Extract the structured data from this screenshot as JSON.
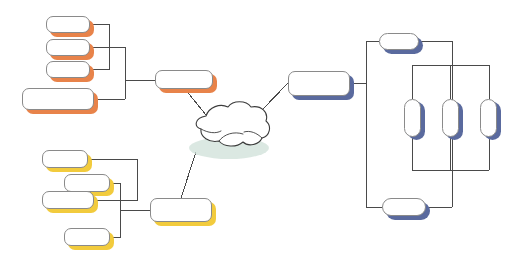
{
  "diagram": {
    "type": "network-topology",
    "background": "#ffffff",
    "line_color": "#4a4a4a",
    "node_border": "#8a8a8a",
    "node_fill": "#ffffff",
    "palette": {
      "orange": "#e8834a",
      "yellow": "#f2cb3d",
      "blue": "#5a6a9e",
      "cloud_shadow": "#cfe0d8",
      "cloud_outline": "#3c3c3c"
    },
    "groups": [
      {
        "id": "orange-group",
        "label": "",
        "color": "#e8834a"
      },
      {
        "id": "yellow-group",
        "label": "",
        "color": "#f2cb3d"
      },
      {
        "id": "blue-group",
        "label": "",
        "color": "#5a6a9e"
      }
    ],
    "cloud": {
      "label": "",
      "x": 186,
      "y": 104,
      "w": 84,
      "h": 48
    },
    "nodes": [
      {
        "id": "o1",
        "label": "",
        "group": "orange",
        "shape": "rounded",
        "x": 46,
        "y": 16,
        "w": 44,
        "h": 17
      },
      {
        "id": "o2",
        "label": "",
        "group": "orange",
        "shape": "rounded",
        "x": 46,
        "y": 39,
        "w": 44,
        "h": 17
      },
      {
        "id": "o3",
        "label": "",
        "group": "orange",
        "shape": "rounded",
        "x": 46,
        "y": 61,
        "w": 44,
        "h": 17
      },
      {
        "id": "o4",
        "label": "",
        "group": "orange",
        "shape": "rounded",
        "x": 22,
        "y": 88,
        "w": 72,
        "h": 22
      },
      {
        "id": "o5",
        "label": "",
        "group": "orange",
        "shape": "rounded",
        "x": 155,
        "y": 70,
        "w": 58,
        "h": 19
      },
      {
        "id": "y1",
        "label": "",
        "group": "yellow",
        "shape": "rounded",
        "x": 42,
        "y": 150,
        "w": 46,
        "h": 18
      },
      {
        "id": "y2",
        "label": "",
        "group": "yellow",
        "shape": "rounded",
        "x": 64,
        "y": 174,
        "w": 46,
        "h": 18
      },
      {
        "id": "y3",
        "label": "",
        "group": "yellow",
        "shape": "rounded",
        "x": 42,
        "y": 191,
        "w": 52,
        "h": 18
      },
      {
        "id": "y4",
        "label": "",
        "group": "yellow",
        "shape": "rounded",
        "x": 64,
        "y": 228,
        "w": 46,
        "h": 18
      },
      {
        "id": "y5",
        "label": "",
        "group": "yellow",
        "shape": "rounded",
        "x": 150,
        "y": 198,
        "w": 62,
        "h": 24
      },
      {
        "id": "b1",
        "label": "",
        "group": "blue",
        "shape": "rounded",
        "x": 288,
        "y": 71,
        "w": 62,
        "h": 25
      },
      {
        "id": "b2",
        "label": "",
        "group": "blue",
        "shape": "capsule",
        "x": 379,
        "y": 33,
        "w": 40,
        "h": 17
      },
      {
        "id": "b3",
        "label": "",
        "group": "blue",
        "shape": "capsule",
        "x": 404,
        "y": 99,
        "w": 17,
        "h": 38
      },
      {
        "id": "b4",
        "label": "",
        "group": "blue",
        "shape": "capsule",
        "x": 442,
        "y": 99,
        "w": 17,
        "h": 38
      },
      {
        "id": "b5",
        "label": "",
        "group": "blue",
        "shape": "capsule",
        "x": 480,
        "y": 99,
        "w": 17,
        "h": 38
      },
      {
        "id": "b6",
        "label": "",
        "group": "blue",
        "shape": "capsule",
        "x": 382,
        "y": 198,
        "w": 44,
        "h": 18
      }
    ],
    "links": [
      {
        "from": "o1",
        "to": "orange-bus"
      },
      {
        "from": "o2",
        "to": "orange-bus"
      },
      {
        "from": "o3",
        "to": "orange-bus"
      },
      {
        "from": "o4",
        "to": "orange-bus"
      },
      {
        "from": "orange-bus",
        "to": "o5"
      },
      {
        "from": "o5",
        "to": "cloud"
      },
      {
        "from": "y1",
        "to": "yellow-bus"
      },
      {
        "from": "y2",
        "to": "yellow-bus"
      },
      {
        "from": "y3",
        "to": "yellow-bus"
      },
      {
        "from": "y4",
        "to": "yellow-bus"
      },
      {
        "from": "yellow-bus",
        "to": "y5"
      },
      {
        "from": "y5",
        "to": "cloud"
      },
      {
        "from": "cloud",
        "to": "b1"
      },
      {
        "from": "b1",
        "to": "blue-ring"
      },
      {
        "from": "blue-ring",
        "to": "b2"
      },
      {
        "from": "blue-ring",
        "to": "b3"
      },
      {
        "from": "blue-ring",
        "to": "b4"
      },
      {
        "from": "blue-ring",
        "to": "b5"
      },
      {
        "from": "blue-ring",
        "to": "b6"
      }
    ]
  }
}
